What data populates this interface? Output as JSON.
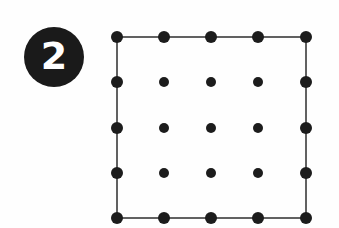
{
  "figure": {
    "background_color": "#fefefe",
    "badge": {
      "label": "2",
      "bg_color": "#1a1a1a",
      "text_color": "#ffffff"
    },
    "dot_grid": {
      "rows": 5,
      "cols": 5,
      "x_positions": [
        117,
        164,
        211,
        258,
        306
      ],
      "y_positions": [
        37,
        82,
        128,
        173,
        218
      ],
      "border_dot_radius": 6,
      "inner_dot_radius": 5,
      "dot_color": "#1c1c1c",
      "outline": {
        "shape": "square-through-border-dots",
        "stroke_color": "#2e2e2e",
        "stroke_width": 1.5
      }
    }
  }
}
